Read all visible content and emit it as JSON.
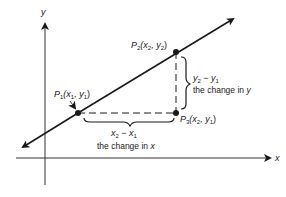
{
  "diagram": {
    "axes": {
      "x_label": "x",
      "y_label": "y"
    },
    "points": [
      {
        "id": "P1",
        "name": "P",
        "sub": "1",
        "coords_text": "(x",
        "c1sub": "1",
        "sep": ", y",
        "c2sub": "1",
        "close": ")"
      },
      {
        "id": "P2",
        "name": "P",
        "sub": "2",
        "coords_text": "(x",
        "c1sub": "2",
        "sep": ", y",
        "c2sub": "2",
        "close": ")"
      },
      {
        "id": "P3",
        "name": "P",
        "sub": "3",
        "coords_text": "(x",
        "c1sub": "2",
        "sep": ", y",
        "c2sub": "1",
        "close": ")"
      }
    ],
    "rise": {
      "expr_a": "y",
      "expr_a_sub": "2",
      "minus": " − ",
      "expr_b": "y",
      "expr_b_sub": "1",
      "caption": "the change in ",
      "caption_var": "y"
    },
    "run": {
      "expr_a": "x",
      "expr_a_sub": "2",
      "minus": " − ",
      "expr_b": "x",
      "expr_b_sub": "1",
      "caption": "the change in ",
      "caption_var": "x"
    },
    "colors": {
      "ink": "#1a1a1a",
      "axis": "#333333",
      "background": "#ffffff"
    }
  }
}
